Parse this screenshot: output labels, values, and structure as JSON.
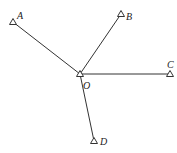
{
  "diagram": {
    "center": {
      "label": "O",
      "x": 80,
      "y": 74,
      "label_x": 83,
      "label_y": 89
    },
    "points": [
      {
        "label": "A",
        "x": 13,
        "y": 22,
        "label_x": 17,
        "label_y": 19
      },
      {
        "label": "B",
        "x": 121,
        "y": 14,
        "label_x": 126,
        "label_y": 20
      },
      {
        "label": "C",
        "x": 170,
        "y": 74,
        "label_x": 167,
        "label_y": 68
      },
      {
        "label": "D",
        "x": 94,
        "y": 141,
        "label_x": 100,
        "label_y": 145
      }
    ],
    "line_color": "#333333"
  }
}
